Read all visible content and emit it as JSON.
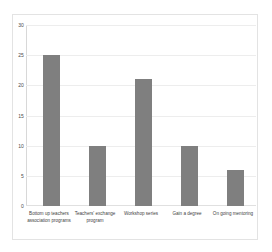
{
  "chart_data": {
    "type": "bar",
    "title": "",
    "subtitle": "",
    "xlabel": "",
    "ylabel": "",
    "categories": [
      "Bottom up teachers association programs",
      "Teachers' exchange program",
      "Workshop series",
      "Gain a degree",
      "On going mentoring"
    ],
    "values": [
      25,
      10,
      21,
      10,
      6
    ],
    "ylim": [
      0,
      30
    ],
    "yticks": [
      0,
      5,
      10,
      15,
      20,
      25,
      30
    ],
    "ytick_labels": [
      "0",
      "5",
      "10",
      "15",
      "20",
      "25",
      "30"
    ],
    "grid": true,
    "legend": false,
    "legend_position": "none",
    "bar_color": "#7f7f7f",
    "gridline_color": "#ededed",
    "background_color": "#ffffff",
    "border_color": "#e3e3e3"
  }
}
